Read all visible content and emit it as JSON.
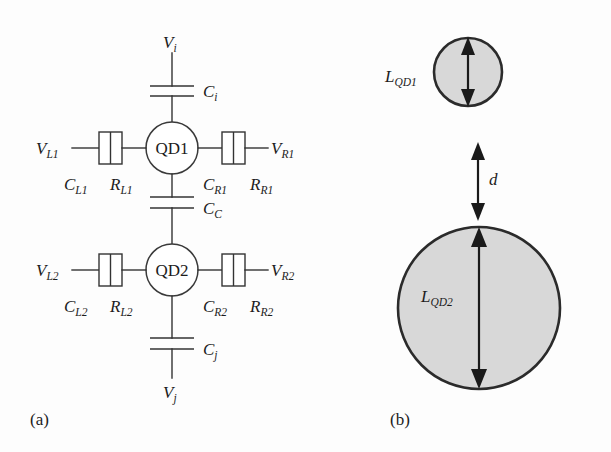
{
  "figure": {
    "panels": [
      {
        "id": "a",
        "caption": "(a)"
      },
      {
        "id": "b",
        "caption": "(b)"
      }
    ]
  },
  "panel_a": {
    "caption": "(a)",
    "dots": [
      {
        "name": "QD1",
        "label": "QD1"
      },
      {
        "name": "QD2",
        "label": "QD2"
      }
    ],
    "terminals": {
      "top_voltage": "V",
      "top_voltage_sub": "i",
      "bottom_voltage": "V",
      "bottom_voltage_sub": "j",
      "left_voltage_1": "V",
      "left_voltage_1_sub": "L1",
      "right_voltage_1": "V",
      "right_voltage_1_sub": "R1",
      "left_voltage_2": "V",
      "left_voltage_2_sub": "L2",
      "right_voltage_2": "V",
      "right_voltage_2_sub": "R2"
    },
    "capacitors": {
      "top": "C",
      "top_sub": "i",
      "coupling": "C",
      "coupling_sub": "C",
      "bottom": "C",
      "bottom_sub": "j",
      "left_1": "C",
      "left_1_sub": "L1",
      "right_1": "C",
      "right_1_sub": "R1",
      "left_2": "C",
      "left_2_sub": "L2",
      "right_2": "C",
      "right_2_sub": "R2"
    },
    "resistors": {
      "left_1": "R",
      "left_1_sub": "L1",
      "right_1": "R",
      "right_1_sub": "R1",
      "left_2": "R",
      "left_2_sub": "L2",
      "right_2": "R",
      "right_2_sub": "R2"
    }
  },
  "panel_b": {
    "caption": "(b)",
    "qd1_size_label": "L",
    "qd1_size_sub": "QD1",
    "qd2_size_label": "L",
    "qd2_size_sub": "QD2",
    "separation_label": "d",
    "sphere_fill": "#d8d8d8",
    "sphere_stroke": "#2b2b2b"
  },
  "colors": {
    "line": "#333333",
    "text": "#1c1c1c",
    "background": "#fdfdfd",
    "sphere_fill": "#d8d8d8"
  }
}
